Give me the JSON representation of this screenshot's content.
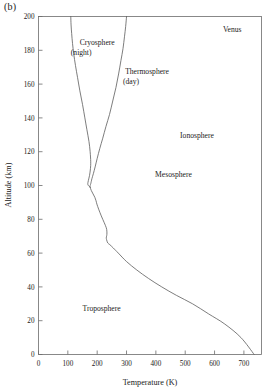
{
  "figure": {
    "panel_label": "(b)",
    "body_label": "Venus"
  },
  "axes": {
    "x": {
      "title": "Temperature (K)",
      "ticks": [
        0,
        100,
        200,
        300,
        400,
        500,
        600,
        700
      ],
      "min": 0,
      "max": 760
    },
    "y": {
      "title": "Altitude (km)",
      "ticks": [
        0,
        20,
        40,
        60,
        80,
        100,
        120,
        140,
        160,
        180,
        200
      ],
      "min": 0,
      "max": 200
    }
  },
  "annotations": [
    {
      "name": "cryosphere",
      "line1": "Cryosphere",
      "line2": "(night)",
      "x_k": 200,
      "y_km": 183
    },
    {
      "name": "thermosphere",
      "line1": "Thermosphere",
      "line2": "(day)",
      "x_k": 370,
      "y_km": 166
    },
    {
      "name": "venus",
      "line1": "Venus",
      "line2": "",
      "x_k": 660,
      "y_km": 191
    },
    {
      "name": "ionosphere",
      "line1": "Ionosphere",
      "line2": "",
      "x_k": 540,
      "y_km": 128
    },
    {
      "name": "mesosphere",
      "line1": "Mesosphere",
      "line2": "",
      "x_k": 460,
      "y_km": 105
    },
    {
      "name": "troposphere",
      "line1": "Troposphere",
      "line2": "",
      "x_k": 215,
      "y_km": 26
    }
  ],
  "chart_data": {
    "type": "line",
    "title": "",
    "xlabel": "Temperature (K)",
    "ylabel": "Altitude (km)",
    "xlim": [
      0,
      760
    ],
    "ylim": [
      0,
      200
    ],
    "grid": false,
    "legend": "inline-annotations",
    "series": [
      {
        "name": "Night profile (cryosphere)",
        "points_t_k": [
          110,
          111,
          113,
          116,
          120,
          126,
          133,
          141,
          150,
          158,
          165,
          172,
          176,
          178,
          177,
          174,
          170,
          168,
          170,
          176
        ],
        "points_alt_km": [
          200,
          195,
          190,
          184,
          178,
          171,
          164,
          156,
          148,
          140,
          133,
          126,
          120,
          114,
          110,
          106,
          103,
          101,
          100,
          99
        ]
      },
      {
        "name": "Day profile (thermosphere)",
        "points_t_k": [
          300,
          297,
          293,
          288,
          281,
          273,
          264,
          253,
          242,
          230,
          219,
          209,
          200,
          193,
          187,
          182,
          178,
          176,
          176
        ],
        "points_alt_km": [
          200,
          194,
          188,
          181,
          174,
          166,
          158,
          150,
          142,
          135,
          128,
          122,
          116,
          111,
          107,
          104,
          101,
          100,
          99
        ]
      },
      {
        "name": "Lower atmosphere (common profile)",
        "points_t_k": [
          176,
          180,
          186,
          192,
          196,
          199,
          205,
          214,
          224,
          231,
          233,
          233,
          232,
          231,
          232,
          236,
          243,
          255,
          272,
          300,
          335,
          375,
          420,
          470,
          525,
          580,
          635,
          690,
          735
        ],
        "points_alt_km": [
          99,
          97,
          95,
          93,
          91,
          89,
          86,
          82,
          78,
          75,
          73,
          71,
          70,
          69,
          68,
          66,
          65,
          63,
          60,
          55,
          50,
          45,
          40,
          35,
          30,
          24,
          18,
          10,
          0
        ]
      }
    ]
  }
}
